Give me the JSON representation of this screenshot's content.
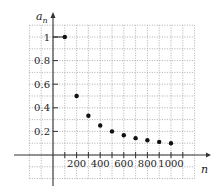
{
  "chart_data": {
    "type": "scatter",
    "title": "",
    "xlabel": "n",
    "ylabel": "a_n",
    "ylabel_main": "a",
    "ylabel_sub": "n",
    "x": [
      100,
      200,
      300,
      400,
      500,
      600,
      700,
      800,
      900,
      1000
    ],
    "values": [
      1,
      0.5,
      0.333,
      0.25,
      0.2,
      0.167,
      0.143,
      0.125,
      0.111,
      0.1
    ],
    "xticks": [
      "200",
      "400",
      "600",
      "800",
      "1000"
    ],
    "xtick_values": [
      200,
      400,
      600,
      800,
      1000
    ],
    "yticks": [
      "0.2",
      "0.4",
      "0.6",
      "0.8",
      "1"
    ],
    "ytick_values": [
      0.2,
      0.4,
      0.6,
      0.8,
      1
    ],
    "xlim": [
      -200,
      1200
    ],
    "ylim": [
      -0.2,
      1.1
    ],
    "grid": true,
    "legend": "none",
    "annotations": [
      "horizontal segment from y-axis to point (100, 1)"
    ]
  },
  "colors": {
    "axis": "#333333",
    "grid": "#9a9a9a",
    "point": "#111111"
  }
}
